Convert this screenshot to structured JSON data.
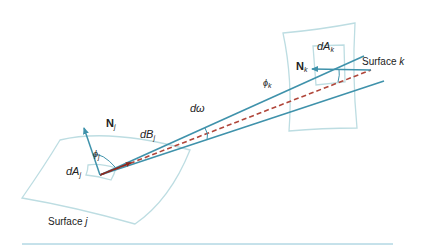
{
  "diagram": {
    "labels": {
      "normal_j": {
        "main": "N",
        "sub": "j"
      },
      "normal_k": {
        "main": "N",
        "sub": "k"
      },
      "area_j": {
        "main": "dA",
        "sub": "j"
      },
      "area_k": {
        "main": "dA",
        "sub": "k"
      },
      "beam_j": {
        "main": "dB",
        "sub": "j"
      },
      "solid_angle": "dω",
      "angle_j": {
        "main": "ϕ",
        "sub": "j"
      },
      "angle_k": {
        "main": "ϕ",
        "sub": "k"
      },
      "surface_j": {
        "text": "Surface ",
        "var": "j"
      },
      "surface_k": {
        "text": "Surface ",
        "var": "k"
      }
    },
    "colors": {
      "beam": "#3f92ab",
      "normal": "#3f92ab",
      "centerline": "#b0463a",
      "surface": "#b9dbe0",
      "rule": "#8cc4d6"
    }
  }
}
